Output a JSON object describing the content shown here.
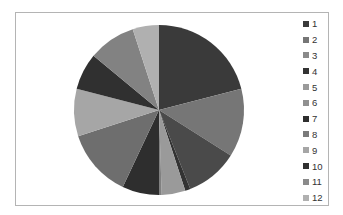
{
  "chart_data": {
    "type": "pie",
    "title": "",
    "legend_position": "right",
    "categories": [
      "1",
      "2",
      "3",
      "4",
      "5",
      "6",
      "7",
      "8",
      "9",
      "10",
      "11",
      "12"
    ],
    "values": [
      21,
      13,
      10,
      1,
      4.5,
      0.5,
      7,
      13,
      9,
      7,
      9,
      5
    ],
    "colors": [
      "#3a3a3a",
      "#767676",
      "#4a4a4a",
      "#333333",
      "#9a9a9a",
      "#808080",
      "#2e2e2e",
      "#6e6e6e",
      "#a6a6a6",
      "#303030",
      "#828282",
      "#b0b0b0"
    ],
    "start_angle_deg": 0,
    "direction": "clockwise"
  },
  "legend": {
    "items": [
      {
        "label": "1",
        "color": "#3a3a3a"
      },
      {
        "label": "2",
        "color": "#767676"
      },
      {
        "label": "3",
        "color": "#8a8a8a"
      },
      {
        "label": "4",
        "color": "#333333"
      },
      {
        "label": "5",
        "color": "#9a9a9a"
      },
      {
        "label": "6",
        "color": "#909090"
      },
      {
        "label": "7",
        "color": "#2e2e2e"
      },
      {
        "label": "8",
        "color": "#7a7a7a"
      },
      {
        "label": "9",
        "color": "#a6a6a6"
      },
      {
        "label": "10",
        "color": "#303030"
      },
      {
        "label": "11",
        "color": "#8a8a8a"
      },
      {
        "label": "12",
        "color": "#b0b0b0"
      }
    ]
  }
}
